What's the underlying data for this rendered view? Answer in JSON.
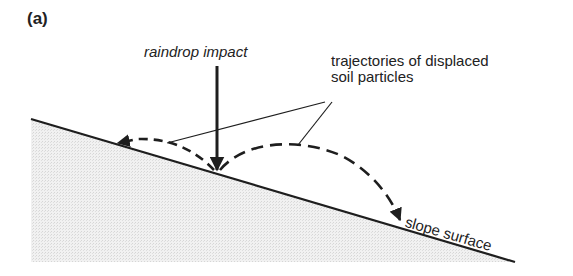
{
  "figure": {
    "panel_label": "(a)",
    "labels": {
      "raindrop_impact": "raindrop impact",
      "trajectories_line1": "trajectories of displaced",
      "trajectories_line2": "soil particles",
      "slope_surface": "slope surface"
    },
    "colors": {
      "line": "#1e1e1e",
      "soil_fill": "#ececec",
      "background": "#ffffff"
    }
  }
}
